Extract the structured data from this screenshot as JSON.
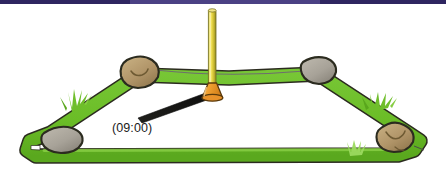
{
  "scene": {
    "title": "Shadow clock sundial on grass rope loop",
    "time_label": "(09:00)",
    "colors": {
      "top_bar": "#2e2560",
      "top_bar_highlight": "#4b4184",
      "grass_green": "#6fbe2b",
      "grass_green_dark": "#55991f",
      "grass_green_light": "#8fd24f",
      "outline_dark": "#2b2b1f",
      "pole_yellow_light": "#f2e36a",
      "pole_yellow_mid": "#e8d23a",
      "pole_yellow_dark": "#8f8a26",
      "base_orange": "#f0a030",
      "base_orange_dark": "#c9741a",
      "rock_brown": "#b39a6b",
      "rock_brown_dark": "#8e7647",
      "rock_grey": "#a9a49a",
      "rock_grey_dark": "#8a857b",
      "shadow_black": "#141414",
      "thread_grey": "#6e6e6e",
      "label_text": "#1a1a1a",
      "background": "#ffffff"
    },
    "elements": {
      "gnomon_pole_name": "vertical yellow pole",
      "gnomon_base_name": "orange conical base",
      "shadow_name": "cast shadow pointing lower-left",
      "loop_name": "green grass rope loop (trapezoid)",
      "thread_name": "thin grey string between upper rocks"
    },
    "rocks": [
      {
        "id": "rock-top-left",
        "label": "tan rock upper left",
        "color": "#b39a6b"
      },
      {
        "id": "rock-top-right",
        "label": "grey rock upper right",
        "color": "#a9a49a"
      },
      {
        "id": "rock-bottom-left",
        "label": "grey rock lower left",
        "color": "#a9a49a"
      },
      {
        "id": "rock-bottom-right",
        "label": "brown rock lower right",
        "color": "#b39a6b"
      }
    ],
    "grass_tufts": [
      {
        "id": "tuft-left",
        "label": "grass tuft on left rope edge"
      },
      {
        "id": "tuft-right",
        "label": "grass tuft on right rope edge"
      },
      {
        "id": "tuft-bottom",
        "label": "pale grass tuft on bottom rope"
      }
    ]
  }
}
